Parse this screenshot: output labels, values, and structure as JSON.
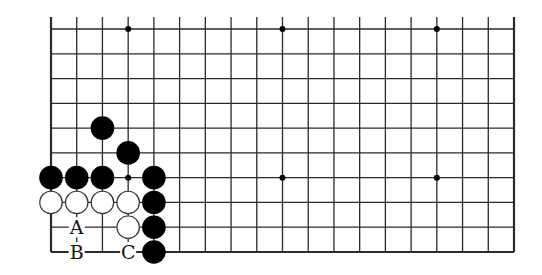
{
  "diagram": {
    "type": "go-board-partial",
    "columns": 19,
    "rows_shown": 10,
    "edges": [
      "left",
      "bottom",
      "right"
    ],
    "colors": {
      "line": "#2a2a2a",
      "black_stone": "#000000",
      "white_stone": "#ffffff",
      "background": "#ffffff"
    },
    "star_points": [
      {
        "col": 3,
        "row": 3
      },
      {
        "col": 9,
        "row": 3
      },
      {
        "col": 15,
        "row": 3
      },
      {
        "col": 3,
        "row": 9
      },
      {
        "col": 9,
        "row": 9
      },
      {
        "col": 15,
        "row": 9
      }
    ],
    "black_stones": [
      {
        "col": 2,
        "row": 5
      },
      {
        "col": 3,
        "row": 4
      },
      {
        "col": 0,
        "row": 3
      },
      {
        "col": 1,
        "row": 3
      },
      {
        "col": 2,
        "row": 3
      },
      {
        "col": 4,
        "row": 3
      },
      {
        "col": 4,
        "row": 2
      },
      {
        "col": 4,
        "row": 1
      },
      {
        "col": 4,
        "row": 0
      }
    ],
    "white_stones": [
      {
        "col": 0,
        "row": 2
      },
      {
        "col": 1,
        "row": 2
      },
      {
        "col": 2,
        "row": 2
      },
      {
        "col": 3,
        "row": 2
      },
      {
        "col": 3,
        "row": 1
      }
    ],
    "labels": [
      {
        "text": "A",
        "col": 1,
        "row": 1
      },
      {
        "text": "B",
        "col": 1,
        "row": 0
      },
      {
        "text": "C",
        "col": 3,
        "row": 0
      }
    ]
  }
}
